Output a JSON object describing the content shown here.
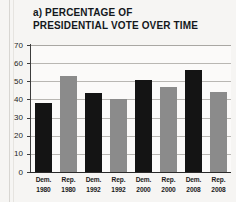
{
  "chart_data": {
    "type": "bar",
    "title": "a) PERCENTAGE OF\nPRESIDENTIAL VOTE OVER TIME",
    "title_line1": "a) PERCENTAGE OF",
    "title_line2": "PRESIDENTIAL VOTE OVER TIME",
    "xlabel": "",
    "ylabel": "",
    "ylim": [
      0,
      70
    ],
    "grid": true,
    "legend": "none",
    "categories": [
      "Dem. 1980",
      "Rep. 1980",
      "Dem. 1992",
      "Rep. 1992",
      "Dem. 2000",
      "Rep. 2000",
      "Dem. 2008",
      "Rep. 2008"
    ],
    "values": [
      38,
      53,
      43.5,
      40.5,
      50.5,
      47,
      56,
      44
    ],
    "bar_parties": [
      "Dem.",
      "Rep.",
      "Dem.",
      "Rep.",
      "Dem.",
      "Rep.",
      "Dem.",
      "Rep."
    ],
    "bar_years": [
      "1980",
      "1980",
      "1992",
      "1992",
      "2000",
      "2000",
      "2008",
      "2008"
    ],
    "ytick_labels": [
      "0",
      "10",
      "20",
      "30",
      "40",
      "50",
      "60",
      "70"
    ],
    "ytick_values": [
      0,
      10,
      20,
      30,
      40,
      50,
      60,
      70
    ],
    "colors": {
      "dem_bar": "#141414",
      "rep_bar": "#8b8b8b",
      "gridline": "#b9b7b3",
      "axis": "#2a2a2a",
      "background": "#f6f5f3",
      "plot_background": "#fbfaf9",
      "text": "#14181c"
    }
  }
}
